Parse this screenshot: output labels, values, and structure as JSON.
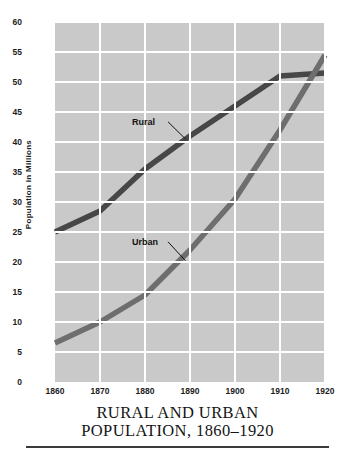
{
  "chart_data": {
    "type": "line",
    "title_line1": "RURAL AND URBAN",
    "title_line2": "POPULATION, 1860–1920",
    "xlabel": "",
    "ylabel": "Population  in  Millions",
    "x": [
      1860,
      1870,
      1880,
      1890,
      1900,
      1910,
      1920
    ],
    "xticklabels": [
      "1860",
      "1870",
      "1880",
      "1890",
      "1900",
      "1910",
      "1920"
    ],
    "yticklabels": [
      "0",
      "5",
      "10",
      "15",
      "20",
      "25",
      "30",
      "35",
      "40",
      "45",
      "50",
      "55",
      "60"
    ],
    "ytickvalues": [
      0,
      5,
      10,
      15,
      20,
      25,
      30,
      35,
      40,
      45,
      50,
      55,
      60
    ],
    "xlim": [
      1860,
      1920
    ],
    "ylim": [
      0,
      60
    ],
    "grid": true,
    "grid_color": "#ffffff",
    "plot_background": "#c9c9c9",
    "legend_position": "inline-annotations",
    "series": [
      {
        "name": "Rural",
        "color": "#474747",
        "values": [
          25.0,
          28.5,
          35.5,
          41.0,
          46.0,
          51.0,
          51.5
        ],
        "annotation": {
          "label": "Rural",
          "label_x": 1882,
          "label_y": 43.2,
          "leader_to_x": 1889,
          "leader_to_y": 40.5
        }
      },
      {
        "name": "Urban",
        "color": "#6e6e6e",
        "values": [
          6.5,
          10.0,
          14.5,
          22.0,
          30.5,
          42.0,
          54.5
        ],
        "annotation": {
          "label": "Urban",
          "label_x": 1882,
          "label_y": 23.2,
          "leader_to_x": 1889,
          "leader_to_y": 20.2
        }
      }
    ]
  }
}
